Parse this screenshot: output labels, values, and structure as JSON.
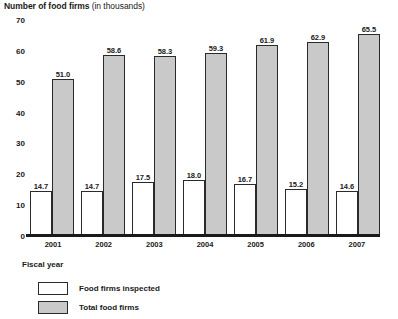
{
  "chart_data": {
    "type": "bar",
    "title": "Number of food firms (in thousands)",
    "title_main": "Number of food firms",
    "title_unit": "(in thousands)",
    "xlabel": "Fiscal year",
    "ylabel": "",
    "ylim": [
      0,
      70
    ],
    "yticks": [
      70,
      60,
      50,
      40,
      30,
      20,
      10,
      0
    ],
    "grid": false,
    "legend_position": "bottom-left",
    "categories": [
      "2001",
      "2002",
      "2003",
      "2004",
      "2005",
      "2006",
      "2007"
    ],
    "series": [
      {
        "name": "Food firms inspected",
        "color": "#ffffff",
        "values": [
          14.7,
          14.7,
          17.5,
          18.0,
          16.7,
          15.2,
          14.6
        ],
        "labels": [
          "14.7",
          "14.7",
          "17.5",
          "18.0",
          "16.7",
          "15.2",
          "14.6"
        ]
      },
      {
        "name": "Total food firms",
        "color": "#c9c9c9",
        "values": [
          51.0,
          58.6,
          58.3,
          59.3,
          61.9,
          62.9,
          65.5
        ],
        "labels": [
          "51.0",
          "58.6",
          "58.3",
          "59.3",
          "61.9",
          "62.9",
          "65.5"
        ]
      }
    ]
  },
  "legend": {
    "items": [
      {
        "label": "Food firms inspected",
        "swatch": "inspected"
      },
      {
        "label": "Total food firms",
        "swatch": "total"
      }
    ]
  }
}
